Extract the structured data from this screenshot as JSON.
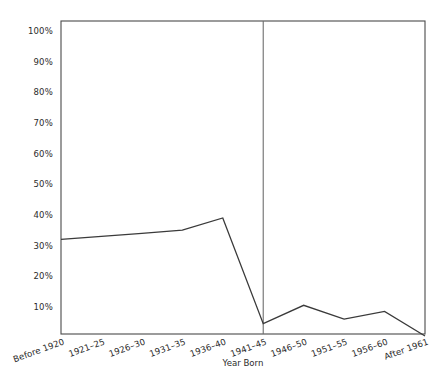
{
  "chart_data": {
    "type": "line",
    "title": "",
    "xlabel": "Year Born",
    "ylabel": "",
    "categories": [
      "Before 1920",
      "1921–25",
      "1926–30",
      "1931–35",
      "1936–40",
      "1941–45",
      "1946–50",
      "1951–55",
      "1956–60",
      "After 1961"
    ],
    "values": [
      32,
      33,
      34,
      35,
      39,
      4.5,
      10.5,
      6,
      8.5,
      0.5
    ],
    "ylim": [
      0,
      100
    ],
    "ytick_labels": [
      "100%",
      "90%",
      "80%",
      "70%",
      "60%",
      "50%",
      "40%",
      "30%",
      "20%",
      "10%"
    ],
    "ytick_values": [
      100,
      90,
      80,
      70,
      60,
      50,
      40,
      30,
      20,
      10
    ],
    "grid": false,
    "legend": "none",
    "annotations": [
      {
        "name": "vertical-divider",
        "at_category": "1941–45",
        "description": "vertical reference line at 1941–45"
      }
    ],
    "series": [
      {
        "name": "series-1",
        "values": [
          32,
          33,
          34,
          35,
          39,
          4.5,
          10.5,
          6,
          8.5,
          0.5
        ]
      }
    ],
    "colors": {
      "line": "#3a3a3a",
      "frame": "#4a4a4a",
      "divider": "#6e6e6e",
      "text": "#2b2b2b",
      "background": "#ffffff"
    },
    "layout": {
      "plot_left": 61,
      "plot_right": 425,
      "plot_top": 21,
      "plot_bottom": 334,
      "y_at_100": 31,
      "y_at_0": 337.5,
      "xtick_rotation_deg": -20
    }
  }
}
